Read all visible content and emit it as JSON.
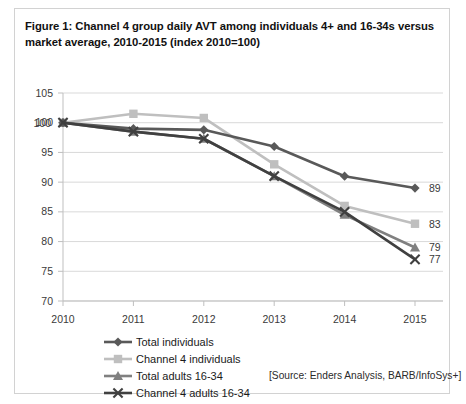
{
  "figure": {
    "caption": "Figure 1: Channel 4 group daily AVT among individuals 4+ and 16-34s versus market average, 2010-2015 (index 2010=100)",
    "source_note": "[Source: Enders Analysis, BARB/InfoSys+]"
  },
  "legend": {
    "position": "bottom",
    "items": [
      {
        "label": "Total individuals",
        "marker": "diamond",
        "color": "#595959"
      },
      {
        "label": "Channel 4 individuals",
        "marker": "square",
        "color": "#bfbfbf"
      },
      {
        "label": "Total adults 16-34",
        "marker": "triangle",
        "color": "#808080"
      },
      {
        "label": "Channel 4 adults 16-34",
        "marker": "x",
        "color": "#404040"
      }
    ]
  },
  "chart_data": {
    "type": "line",
    "title": "Figure 1: Channel 4 group daily AVT among individuals 4+ and 16-34s versus market average, 2010-2015 (index 2010=100)",
    "xlabel": "",
    "ylabel": "",
    "categories": [
      "2010",
      "2011",
      "2012",
      "2013",
      "2014",
      "2015"
    ],
    "ylim": [
      70,
      105
    ],
    "ytick_step": 5,
    "yticks": [
      105,
      100,
      95,
      90,
      85,
      80,
      75,
      70
    ],
    "xticks": [
      "2010",
      "2011",
      "2012",
      "2013",
      "2014",
      "2015"
    ],
    "grid": true,
    "legend_position": "bottom",
    "series": [
      {
        "name": "Total individuals",
        "color": "#595959",
        "marker": "diamond",
        "values": [
          100,
          99,
          98.8,
          96,
          91,
          89
        ]
      },
      {
        "name": "Channel 4 individuals",
        "color": "#bfbfbf",
        "marker": "square",
        "values": [
          100,
          101.5,
          100.8,
          93,
          86,
          83
        ]
      },
      {
        "name": "Total adults 16-34",
        "color": "#808080",
        "marker": "triangle",
        "values": [
          100,
          98.5,
          97.3,
          91,
          84.5,
          79
        ]
      },
      {
        "name": "Channel 4 adults 16-34",
        "color": "#404040",
        "marker": "x",
        "values": [
          100,
          98.5,
          97.3,
          91,
          85,
          77
        ]
      }
    ],
    "annotations": [
      {
        "text": "100",
        "x": "2010",
        "y": 100,
        "placement": "left"
      },
      {
        "text": "89",
        "x": "2015",
        "y": 89,
        "placement": "right"
      },
      {
        "text": "83",
        "x": "2015",
        "y": 83,
        "placement": "right"
      },
      {
        "text": "79",
        "x": "2015",
        "y": 79,
        "placement": "right"
      },
      {
        "text": "77",
        "x": "2015",
        "y": 77,
        "placement": "right"
      }
    ]
  }
}
